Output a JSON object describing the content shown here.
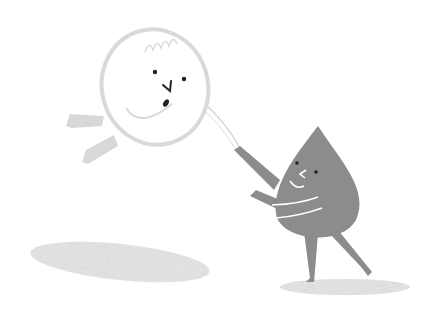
{
  "scene": {
    "description": "Illustration of a pale round ball character flying while a grey water-drop character holds it by a string",
    "background_color": "#ffffff",
    "colors": {
      "ball_outline": "#d9d9d9",
      "ball_fill": "#ffffff",
      "drop_fill": "#8c8c8c",
      "face_features": "#222222",
      "ground_shadow": "#d6d6d6"
    },
    "characters": [
      {
        "name": "ball-character",
        "expression": "surprised, open mouth"
      },
      {
        "name": "drop-character",
        "expression": "smiling, winking"
      }
    ]
  }
}
